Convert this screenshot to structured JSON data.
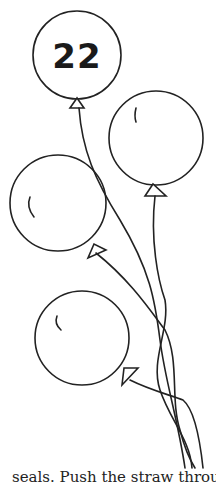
{
  "illustration": {
    "subject": "bunch of balloons",
    "balloon_count": 4,
    "number_label": "22",
    "stroke_color": "#222222"
  },
  "caption": {
    "text": "seals. Push the straw through th"
  }
}
